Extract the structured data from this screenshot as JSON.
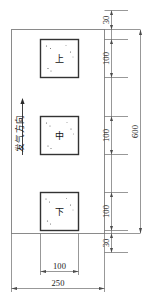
{
  "drawing": {
    "type": "engineering-plan-view",
    "plate": {
      "width_label": "250",
      "height_label": "600"
    },
    "flow": {
      "label": "发气方向",
      "arrow": "up-arrow-icon"
    },
    "cells": [
      {
        "id": "upper",
        "label": "上"
      },
      {
        "id": "middle",
        "label": "中"
      },
      {
        "id": "lower",
        "label": "下"
      }
    ],
    "dimensions": {
      "right_chain": [
        {
          "name": "top-margin",
          "value": "30"
        },
        {
          "name": "upper-cell",
          "value": "100"
        },
        {
          "name": "middle-cell",
          "value": "100"
        },
        {
          "name": "lower-cell",
          "value": "100"
        },
        {
          "name": "bottom-margin",
          "value": "30"
        }
      ],
      "right_overall": {
        "name": "overall-height",
        "value": "600"
      },
      "bottom_chain": [
        {
          "name": "cell-width",
          "value": "100"
        }
      ],
      "bottom_overall": {
        "name": "overall-width",
        "value": "250"
      }
    },
    "colors": {
      "outline": "#8a8a8a",
      "cell_outline": "#333333",
      "dimension_line": "#6b6b6b",
      "text": "#1a1a1a",
      "background": "#ffffff"
    }
  }
}
